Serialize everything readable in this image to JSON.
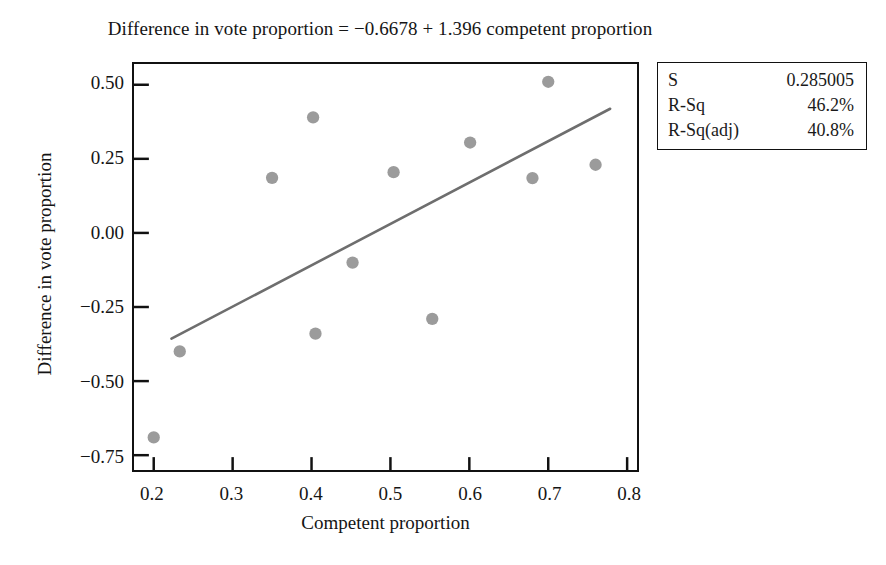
{
  "chart_data": {
    "type": "scatter",
    "title": "Difference in vote proportion = −0.6678 + 1.396 competent proportion",
    "xlabel": "Competent proportion",
    "ylabel": "Difference in vote proportion",
    "xlim": [
      0.175,
      0.8125
    ],
    "ylim": [
      -0.8,
      0.57
    ],
    "xticks": [
      0.2,
      0.3,
      0.4,
      0.5,
      0.6,
      0.7,
      0.8
    ],
    "xtick_labels": [
      "0.2",
      "0.3",
      "0.4",
      "0.5",
      "0.6",
      "0.7",
      "0.8"
    ],
    "yticks": [
      0.5,
      0.25,
      0.0,
      -0.25,
      -0.5,
      -0.75
    ],
    "ytick_labels": [
      "0.50",
      "0.25",
      "0.00",
      "−0.25",
      "−0.50",
      "−0.75"
    ],
    "grid": false,
    "legend": false,
    "marker_color": "#9b9b9b",
    "line_color": "#6e6e6e",
    "frame_color": "#111111",
    "points": [
      {
        "x": 0.2,
        "y": -0.69
      },
      {
        "x": 0.233,
        "y": -0.4
      },
      {
        "x": 0.35,
        "y": 0.186
      },
      {
        "x": 0.402,
        "y": 0.39
      },
      {
        "x": 0.405,
        "y": -0.34
      },
      {
        "x": 0.452,
        "y": -0.1
      },
      {
        "x": 0.504,
        "y": 0.205
      },
      {
        "x": 0.553,
        "y": -0.29
      },
      {
        "x": 0.601,
        "y": 0.305
      },
      {
        "x": 0.68,
        "y": 0.185
      },
      {
        "x": 0.7,
        "y": 0.51
      },
      {
        "x": 0.76,
        "y": 0.23
      }
    ],
    "fit_line": {
      "intercept": -0.6678,
      "slope": 1.396,
      "x_start": 0.2225,
      "x_end": 0.7785,
      "y_start": -0.357,
      "y_end": 0.419
    }
  },
  "stats_box": {
    "rows": [
      {
        "key": "S",
        "value": "0.285005"
      },
      {
        "key": "R-Sq",
        "value": "46.2%"
      },
      {
        "key": "R-Sq(adj)",
        "value": "40.8%"
      }
    ]
  }
}
